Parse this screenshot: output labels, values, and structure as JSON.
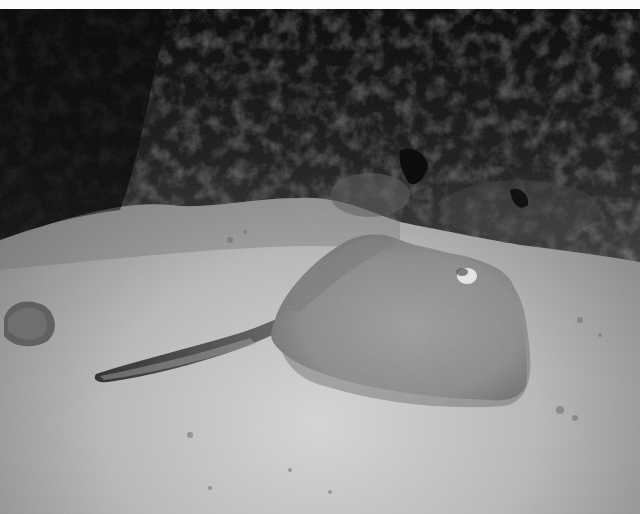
{
  "image": {
    "kind": "photograph",
    "mode": "black-and-white",
    "subject": "stingray",
    "scene": "stingray resting on sandy seabed beneath dark rocky reef at night",
    "border_top_color": "#fbfbfb",
    "palette": {
      "rock_dark": "#0a0a0a",
      "rock_mid": "#3a3a3a",
      "sand_light": "#c8c8c8",
      "sand_mid": "#9a9a9a",
      "ray_body": "#8e8e8e",
      "ray_tail": "#3c3c3c"
    },
    "elements": [
      {
        "name": "rocky-reef",
        "region": "top half, dark, textured"
      },
      {
        "name": "sandy-seabed",
        "region": "bottom half, pale gray"
      },
      {
        "name": "stingray",
        "region": "center-right, body ~265-530 x, 232-402 y; tail extending left to ~95 x"
      },
      {
        "name": "rock-lump",
        "region": "left edge near 0-55 x, 295-345 y"
      }
    ]
  }
}
